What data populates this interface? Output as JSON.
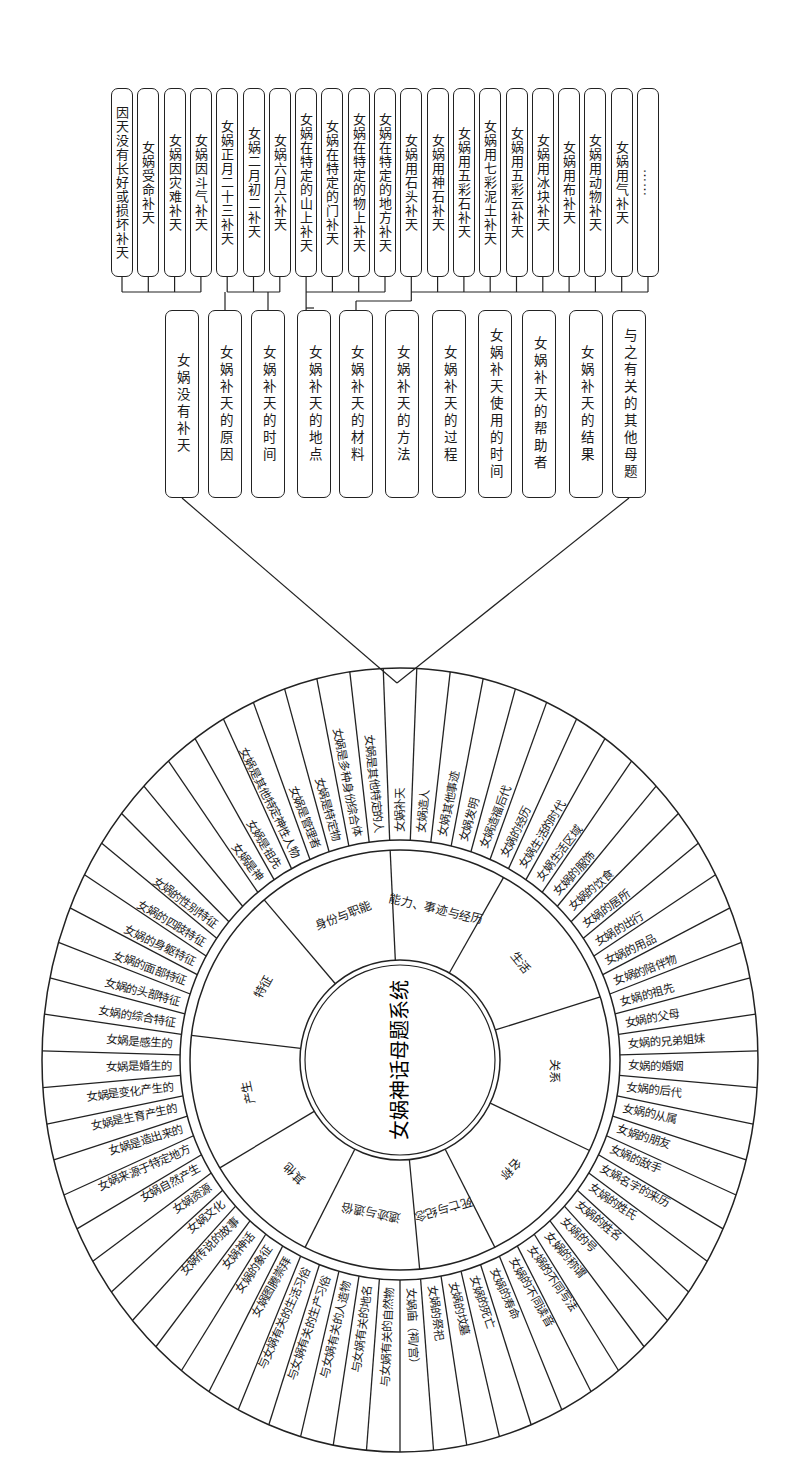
{
  "title": "女娲神话母题系统",
  "leaf_boxes": [
    "因天没有长好或损坏补天",
    "女娲受命补天",
    "女娲因灾难补天",
    "女娲因斗气补天",
    "女娲正月二十三补天",
    "女娲二月初二补天",
    "女娲六月六补天",
    "女娲在特定的山上补天",
    "女娲在特定的门补天",
    "女娲在特定的物上补天",
    "女娲在特定的地方补天",
    "女娲用石头补天",
    "女娲用神石补天",
    "女娲用五彩石补天",
    "女娲用七彩泥土补天",
    "女娲用五彩云补天",
    "女娲用冰块补天",
    "女娲用布补天",
    "女娲用动物补天",
    "女娲用气补天",
    "……"
  ],
  "mid_boxes": [
    "女娲没有补天",
    "女娲补天的原因",
    "女娲补天的时间",
    "女娲补天的地点",
    "女娲补天的材料",
    "女娲补天的方法",
    "女娲补天的过程",
    "女娲补天使用的时间",
    "女娲补天的帮助者",
    "女娲补天的结果",
    "与之有关的其他母题"
  ],
  "groups": [
    {
      "parent": 1,
      "children": [
        0,
        1,
        2,
        3
      ]
    },
    {
      "parent": 2,
      "children": [
        4,
        5,
        6
      ]
    },
    {
      "parent": 3,
      "children": [
        7,
        8,
        9,
        10
      ]
    },
    {
      "parent": 4,
      "children": [
        11,
        12,
        13,
        14,
        15,
        16,
        17,
        18,
        19,
        20
      ]
    }
  ],
  "circle": {
    "center_title": "女娲神话母题系统",
    "categories": [
      {
        "label": "能力、事迹与经历",
        "items": [
          "女娲补天",
          "女娲造人",
          "女娲其他事迹",
          "女娲发明",
          "女娲造福后代",
          "女娲的经历"
        ]
      },
      {
        "label": "生活",
        "items": [
          "女娲生活的时代",
          "女娲生活区域",
          "女娲的服饰",
          "女娲的饮食",
          "女娲的居所",
          "女娲的出行",
          "女娲的用品",
          "女娲的陪伴物"
        ]
      },
      {
        "label": "关系",
        "items": [
          "女娲的祖先",
          "女娲的父母",
          "女娲的兄弟姐妹",
          "女娲的婚姻",
          "女娲的后代",
          "女娲的从属",
          "女娲的朋友",
          "女娲的敌手"
        ]
      },
      {
        "label": "名称",
        "items": [
          "女娲名字的来历",
          "女娲的姓氏",
          "女娲的姓名",
          "女娲的号",
          "女娲的称谓",
          "女娲的不同写法",
          "女娲的不同读音"
        ]
      },
      {
        "label": "死亡与纪念",
        "items": [
          "女娲的寿命",
          "女娲的死亡",
          "女娲的坟墓",
          "女娲的祭祀"
        ]
      },
      {
        "label": "遗迹与遗俗",
        "items": [
          "女娲庙（祠/宫）",
          "与女娲有关的自然物",
          "与女娲有关的地名",
          "与女娲有关的人造物",
          "与女娲有关的生产习俗",
          "与女娲有关的生活习俗"
        ]
      },
      {
        "label": "其他",
        "items": [
          "女娲图腾崇拜",
          "女娲的象征",
          "女娲神话",
          "女娲传说的故事",
          "女娲文化",
          "女娲资源"
        ]
      },
      {
        "label": "产生",
        "items": [
          "女娲自然产生",
          "女娲来源于特定地方",
          "女娲是造出来的",
          "女娲是生育产生的",
          "女娲是变化产生的",
          "女娲是婚生的",
          "女娲是感生的"
        ]
      },
      {
        "label": "特征",
        "items": [
          "女娲的综合特征",
          "女娲的头部特征",
          "女娲的面部特征",
          "女娲的身躯特征",
          "女娲的四肢特征",
          "女娲的性别特征",
          "",
          ""
        ]
      },
      {
        "label": "身份与职能",
        "items": [
          "女娲是神",
          "女娲是祖先",
          "女娲是其他特定神性人物",
          "女娲是管理者",
          "女娲是特定物",
          "女娲是多种身份综合体",
          "女娲是其他特定的人"
        ]
      }
    ]
  },
  "colors": {
    "line": "#222222",
    "background": "#ffffff",
    "text": "#1a1a1a"
  }
}
